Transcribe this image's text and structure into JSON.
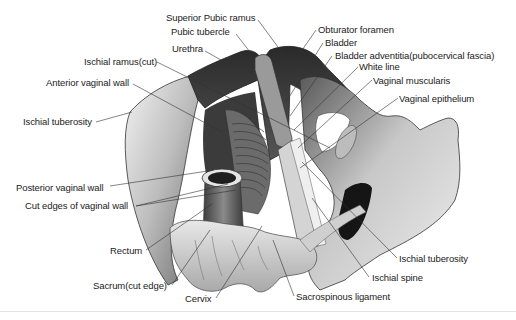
{
  "figure": {
    "labels": {
      "superior_pubic_ramus": "Superior Pubic ramus",
      "pubic_tubercle": "Pubic tubercle",
      "urethra": "Urethra",
      "ischial_ramus_cut": "Ischial ramus(cut)",
      "anterior_vaginal_wall": "Anterior vaginal wall",
      "ischial_tuberosity_left": "Ischial tuberosity",
      "obturator_foramen": "Obturator foramen",
      "bladder": "Bladder",
      "bladder_adventitia": "Bladder adventitia(pubocervical fascia)",
      "white_line": "White line",
      "vaginal_muscularis": "Vaginal muscularis",
      "vaginal_epithelium": "Vaginal epithelium",
      "posterior_vaginal_wall": "Posterior vaginal wall",
      "cut_edges_vaginal_wall": "Cut edges of vaginal wall",
      "rectum": "Rectum",
      "sacrum_cut_edge": "Sacrum(cut edge)",
      "cervix": "Cervix",
      "ischial_tuberosity_right": "Ischial tuberosity",
      "ischial_spine": "Ischial spine",
      "sacrospinous_ligament": "Sacrospinous ligament"
    }
  }
}
